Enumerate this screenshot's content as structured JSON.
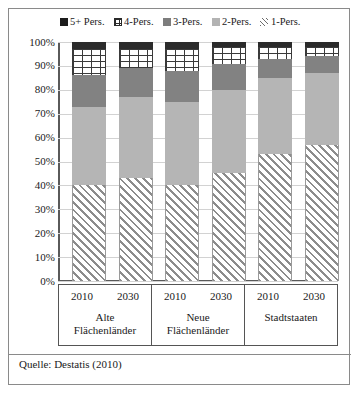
{
  "legend": {
    "items": [
      {
        "label": "5+ Pers.",
        "icon": "square-marker-black",
        "color": "#2b2b2b"
      },
      {
        "label": "4-Pers.",
        "icon": "grid-marker",
        "color": "#ffffff"
      },
      {
        "label": "3-Pers.",
        "icon": "square-marker-dark-gray",
        "color": "#828282"
      },
      {
        "label": "2-Pers.",
        "icon": "square-marker-light-gray",
        "color": "#b5b5b5"
      },
      {
        "label": "1-Pers.",
        "icon": "hatch-marker",
        "color": "#ffffff"
      }
    ]
  },
  "yaxis": {
    "ticks": [
      "100%",
      "90%",
      "80%",
      "70%",
      "60%",
      "50%",
      "40%",
      "30%",
      "20%",
      "10%",
      "0%"
    ]
  },
  "groups": [
    {
      "name_line1": "Alte",
      "name_line2": "Flächenländer",
      "years": [
        "2010",
        "2030"
      ]
    },
    {
      "name_line1": "Neue",
      "name_line2": "Flächenländer",
      "years": [
        "2010",
        "2030"
      ]
    },
    {
      "name_line1": "Stadtstaaten",
      "name_line2": "",
      "years": [
        "2010",
        "2030"
      ]
    }
  ],
  "source": "Quelle: Destatis (2010)",
  "chart_data": {
    "type": "bar",
    "title": "",
    "subtitle": "",
    "xlabel": "",
    "ylabel": "",
    "ylim": [
      0,
      100
    ],
    "grid": true,
    "stacked": true,
    "stack_order_bottom_to_top": [
      "1-Pers.",
      "2-Pers.",
      "3-Pers.",
      "4-Pers.",
      "5+ Pers."
    ],
    "legend_position": "top-center",
    "categories": [
      "Alte Flächenländer 2010",
      "Alte Flächenländer 2030",
      "Neue Flächenländer 2010",
      "Neue Flächenländer 2030",
      "Stadtstaaten 2010",
      "Stadtstaaten 2030"
    ],
    "series": [
      {
        "name": "1-Pers.",
        "values": [
          40,
          43,
          40,
          45,
          53,
          57
        ]
      },
      {
        "name": "2-Pers.",
        "values": [
          33,
          34,
          35,
          35,
          32,
          30
        ]
      },
      {
        "name": "3-Pers.",
        "values": [
          13,
          12,
          13,
          11,
          8,
          7
        ]
      },
      {
        "name": "4-Pers.",
        "values": [
          11,
          8,
          9,
          7,
          5,
          4
        ]
      },
      {
        "name": "5+ Pers.",
        "values": [
          3,
          3,
          3,
          2,
          2,
          2
        ]
      }
    ]
  }
}
